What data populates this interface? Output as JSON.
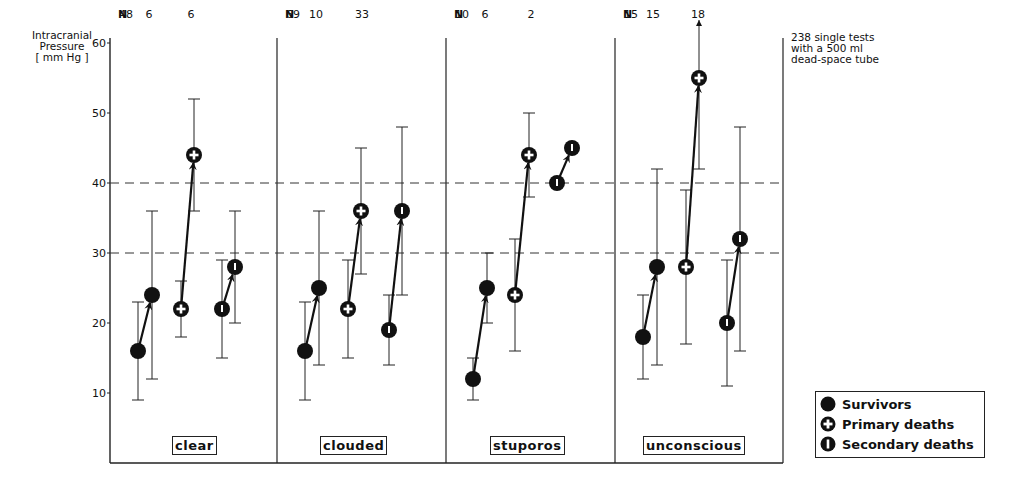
{
  "chart_data": {
    "type": "scatter",
    "title": "",
    "ylabel": "Intracranial Pressure [ mm Hg ]",
    "ylabel_lines": [
      "Intracranial",
      "Pressure",
      "[ mm Hg ]"
    ],
    "ylim": [
      5,
      62
    ],
    "yticks": [
      10,
      20,
      30,
      40,
      50,
      60
    ],
    "reference_lines": [
      30,
      40
    ],
    "note_lines": [
      "238 single tests",
      "with a 500 ml",
      "dead-space tube"
    ],
    "n_label": "N",
    "panels": [
      {
        "category": "clear",
        "groups": [
          {
            "group": "Survivors",
            "n": 48,
            "before": {
              "mean": 16,
              "low": 9,
              "high": 23
            },
            "after": {
              "mean": 24,
              "low": 12,
              "high": 36
            }
          },
          {
            "group": "Primary deaths",
            "n": 6,
            "before": {
              "mean": 22,
              "low": 18,
              "high": 26
            },
            "after": {
              "mean": 44,
              "low": 36,
              "high": 52
            }
          },
          {
            "group": "Secondary deaths",
            "n": 6,
            "before": {
              "mean": 22,
              "low": 15,
              "high": 29
            },
            "after": {
              "mean": 28,
              "low": 20,
              "high": 36
            }
          }
        ]
      },
      {
        "category": "clouded",
        "groups": [
          {
            "group": "Survivors",
            "n": 69,
            "before": {
              "mean": 16,
              "low": 9,
              "high": 23
            },
            "after": {
              "mean": 25,
              "low": 14,
              "high": 36
            }
          },
          {
            "group": "Primary deaths",
            "n": 10,
            "before": {
              "mean": 22,
              "low": 15,
              "high": 29
            },
            "after": {
              "mean": 36,
              "low": 27,
              "high": 45
            }
          },
          {
            "group": "Secondary deaths",
            "n": 33,
            "before": {
              "mean": 19,
              "low": 14,
              "high": 24
            },
            "after": {
              "mean": 36,
              "low": 24,
              "high": 48
            }
          }
        ]
      },
      {
        "category": "stuporos",
        "groups": [
          {
            "group": "Survivors",
            "n": 10,
            "before": {
              "mean": 12,
              "low": 9,
              "high": 15
            },
            "after": {
              "mean": 25,
              "low": 20,
              "high": 30
            }
          },
          {
            "group": "Primary deaths",
            "n": 6,
            "before": {
              "mean": 24,
              "low": 16,
              "high": 32
            },
            "after": {
              "mean": 44,
              "low": 38,
              "high": 50
            }
          },
          {
            "group": "Secondary deaths",
            "n": 2,
            "before": {
              "mean": 40,
              "low": null,
              "high": null
            },
            "after": {
              "mean": 45,
              "low": null,
              "high": null
            }
          }
        ]
      },
      {
        "category": "unconscious",
        "groups": [
          {
            "group": "Survivors",
            "n": 15,
            "before": {
              "mean": 18,
              "low": 12,
              "high": 24
            },
            "after": {
              "mean": 28,
              "low": 14,
              "high": 42
            }
          },
          {
            "group": "Primary deaths",
            "n": 15,
            "before": {
              "mean": 28,
              "low": 17,
              "high": 39
            },
            "after": {
              "mean": 55,
              "low": 42,
              "high": 60,
              "exceeds_axis": true
            }
          },
          {
            "group": "Secondary deaths",
            "n": 18,
            "before": {
              "mean": 20,
              "low": 11,
              "high": 29
            },
            "after": {
              "mean": 32,
              "low": 16,
              "high": 48
            }
          }
        ]
      }
    ],
    "legend": [
      {
        "marker": "filled-circle",
        "label": "Survivors"
      },
      {
        "marker": "circle-cross",
        "label": "Primary deaths"
      },
      {
        "marker": "circle-bar",
        "label": "Secondary deaths"
      }
    ],
    "legend_position": "bottom-right",
    "grid": false
  }
}
